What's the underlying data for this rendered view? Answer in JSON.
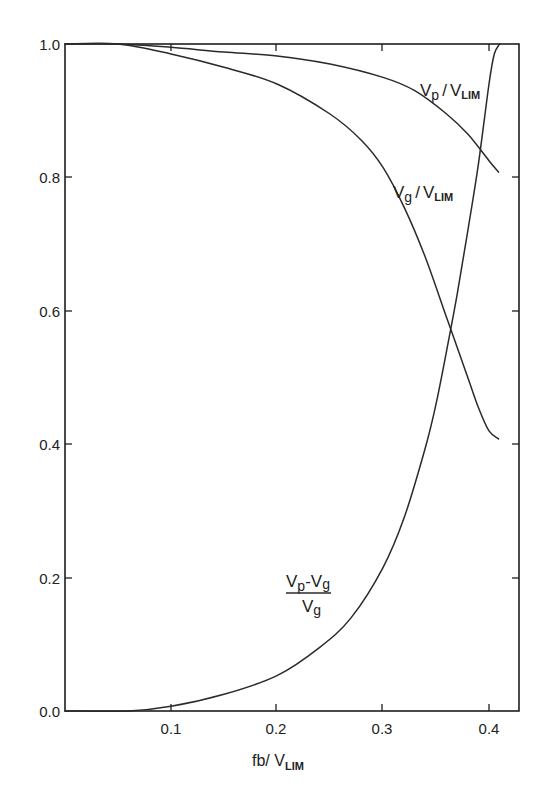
{
  "chart_data": {
    "type": "line",
    "title": "",
    "xlabel": "fb/V_LIM",
    "ylabel": "",
    "xlim": [
      0,
      0.426
    ],
    "ylim": [
      0,
      1.0
    ],
    "grid": false,
    "legend": "inline labels on curves",
    "x_ticks": [
      "0.1",
      "0.2",
      "0.3",
      "0.4"
    ],
    "y_ticks": [
      "0.0",
      "0.2",
      "0.4",
      "0.6",
      "0.8",
      "1.0"
    ],
    "series": [
      {
        "name": "Vp/VLIM",
        "x": [
          0.0,
          0.05,
          0.1,
          0.15,
          0.2,
          0.25,
          0.3,
          0.33,
          0.36,
          0.38,
          0.4,
          0.409
        ],
        "y": [
          1.0,
          1.0,
          0.995,
          0.988,
          0.982,
          0.97,
          0.95,
          0.93,
          0.895,
          0.865,
          0.825,
          0.808
        ]
      },
      {
        "name": "Vg/VLIM",
        "x": [
          0.0,
          0.05,
          0.1,
          0.15,
          0.2,
          0.25,
          0.28,
          0.3,
          0.32,
          0.34,
          0.36,
          0.38,
          0.39,
          0.4,
          0.409
        ],
        "y": [
          1.0,
          1.0,
          0.985,
          0.965,
          0.94,
          0.895,
          0.855,
          0.815,
          0.755,
          0.68,
          0.59,
          0.5,
          0.455,
          0.42,
          0.408
        ]
      },
      {
        "name": "(Vp-Vg)/Vg",
        "x": [
          0.0,
          0.06,
          0.1,
          0.15,
          0.2,
          0.24,
          0.27,
          0.3,
          0.32,
          0.34,
          0.35,
          0.36,
          0.37,
          0.38,
          0.39,
          0.4,
          0.405,
          0.41
        ],
        "y": [
          0.0,
          0.0,
          0.007,
          0.025,
          0.053,
          0.095,
          0.14,
          0.215,
          0.29,
          0.395,
          0.46,
          0.54,
          0.625,
          0.72,
          0.82,
          0.94,
          0.985,
          1.0
        ]
      }
    ],
    "annotations": [
      {
        "text_main": "V",
        "text_sub": "p",
        "slash": "/",
        "text_main2": "V",
        "text_sub2": "LIM",
        "near_series": "Vp/VLIM"
      },
      {
        "text_main": "V",
        "text_sub": "g",
        "slash": "/",
        "text_main2": "V",
        "text_sub2": "LIM",
        "near_series": "Vg/VLIM"
      },
      {
        "numerator": "Vp-Vg",
        "denominator": "Vg",
        "near_series": "(Vp-Vg)/Vg"
      }
    ]
  },
  "labels": {
    "vp": {
      "v": "V",
      "sub": "p",
      "slash": "/",
      "v2": "V",
      "sub2": "LIM"
    },
    "vg": {
      "v": "V",
      "sub": "g",
      "slash": "/",
      "v2": "V",
      "sub2": "LIM"
    },
    "frac": {
      "num_v1": "V",
      "num_s1": "p",
      "minus": "-",
      "num_v2": "V",
      "num_s2": "g",
      "den_v": "V",
      "den_s": "g"
    },
    "xaxis": {
      "main": "fb/ V",
      "sub": "LIM"
    }
  },
  "ticks": {
    "y": [
      "1.0",
      "0.8",
      "0.6",
      "0.4",
      "0.2",
      "0.0"
    ],
    "x": [
      "0.1",
      "0.2",
      "0.3",
      "0.4"
    ]
  },
  "style": {
    "line_color": "#2a2a2a",
    "frame_color": "#1e1e1e",
    "background": "#ffffff"
  }
}
